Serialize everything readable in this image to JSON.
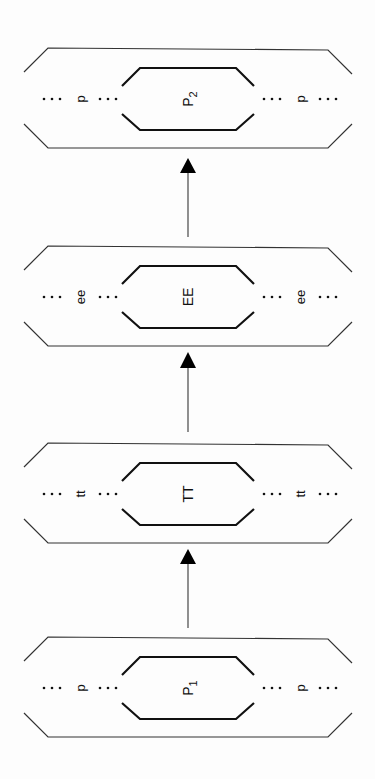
{
  "diagram": {
    "orientation": "rotated-90-cw",
    "nodes": [
      {
        "id": "p2",
        "center": "P",
        "center_sub": "2",
        "side": "p",
        "y": 48
      },
      {
        "id": "ee",
        "center": "EE",
        "center_sub": "",
        "side": "ee",
        "y": 246
      },
      {
        "id": "tt",
        "center": "TT",
        "center_sub": "",
        "side": "tt",
        "y": 443
      },
      {
        "id": "p1",
        "center": "P",
        "center_sub": "1",
        "side": "p",
        "y": 637
      }
    ],
    "dots": "…",
    "edges": [
      {
        "from": "p1",
        "to": "tt"
      },
      {
        "from": "tt",
        "to": "ee"
      },
      {
        "from": "ee",
        "to": "p2"
      }
    ]
  }
}
